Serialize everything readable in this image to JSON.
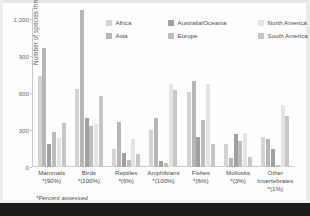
{
  "figure": {
    "ylabel": "Number of species threatened",
    "footnote": "*Percent assessed"
  },
  "legend": {
    "columns": [
      {
        "items": [
          {
            "label": "Africa",
            "color": "#d4d4d4"
          },
          {
            "label": "Asia",
            "color": "#b6b6b6"
          }
        ]
      },
      {
        "items": [
          {
            "label": "Australia/Oceania",
            "color": "#a0a0a0"
          },
          {
            "label": "Europe",
            "color": "#bdbdbd"
          }
        ]
      },
      {
        "items": [
          {
            "label": "North America",
            "color": "#e4e4e4"
          },
          {
            "label": "South America",
            "color": "#c6c6c6"
          }
        ]
      }
    ]
  },
  "chart_data": {
    "type": "bar",
    "title": "",
    "xlabel": "",
    "ylabel": "Number of species threatened",
    "ylim": [
      0,
      1290
    ],
    "yticks": [
      0,
      300,
      600,
      900,
      1200
    ],
    "ytick_labels": [
      "0",
      "300",
      "600",
      "900",
      "1,200"
    ],
    "grid": false,
    "legend_position": "top",
    "categories": [
      "Mammals",
      "Birds",
      "Reptiles",
      "Amphibians",
      "Fishes",
      "Mollusks",
      "Other Invertebrates"
    ],
    "category_sublabels": [
      "*(90%)",
      "*(100%)",
      "*(6%)",
      "*(100%)",
      "*(6%)",
      "*(3%)",
      "*(1%)"
    ],
    "series": [
      {
        "name": "Africa",
        "color": "#d4d4d4",
        "values": [
          735,
          630,
          150,
          300,
          605,
          190,
          240
        ]
      },
      {
        "name": "Asia",
        "color": "#b6b6b6",
        "values": [
          965,
          1270,
          365,
          400,
          700,
          70,
          230
        ]
      },
      {
        "name": "Australia/Oceania",
        "color": "#a0a0a0",
        "values": [
          185,
          400,
          110,
          50,
          245,
          265,
          145
        ]
      },
      {
        "name": "Europe",
        "color": "#bdbdbd",
        "values": [
          285,
          330,
          60,
          30,
          380,
          210,
          20
        ]
      },
      {
        "name": "North America",
        "color": "#e4e4e4",
        "values": [
          235,
          350,
          225,
          670,
          670,
          275,
          500
        ]
      },
      {
        "name": "South America",
        "color": "#c6c6c6",
        "values": [
          360,
          580,
          105,
          625,
          185,
          85,
          415
        ]
      }
    ],
    "notes": "*Percent assessed"
  }
}
